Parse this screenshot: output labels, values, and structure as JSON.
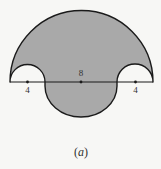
{
  "figure": {
    "caption_open": "(",
    "caption_letter": "a",
    "caption_close": ")",
    "fill_color": "#a9a9a9",
    "stroke_color": "#1a1a1a",
    "labels": {
      "left_segment": "4",
      "center_diameter": "8",
      "right_segment": "4"
    },
    "geometry": {
      "large_semicircle": {
        "cx": 81.5,
        "cy": 82,
        "r": 71.5,
        "side": "upper"
      },
      "left_small_semicircle": {
        "cx": 27.5,
        "cy": 82,
        "r": 17.5,
        "side": "upper",
        "role": "cutout"
      },
      "right_small_semicircle": {
        "cx": 135.5,
        "cy": 82,
        "r": 17.5,
        "side": "upper",
        "role": "cutout"
      },
      "lower_semicircle": {
        "cx": 81,
        "cy": 82,
        "r": 36,
        "side": "lower",
        "role": "added"
      },
      "baseline": {
        "x1": 10,
        "x2": 153,
        "y": 82
      },
      "points": [
        {
          "x": 27.5,
          "y": 82
        },
        {
          "x": 81,
          "y": 82
        },
        {
          "x": 135.5,
          "y": 82
        }
      ]
    }
  }
}
